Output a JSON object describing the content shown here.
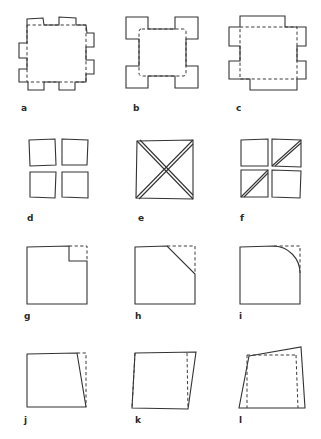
{
  "figure": {
    "background_color": "#ffffff",
    "stroke_color": "#333333",
    "dashed_stroke_color": "#3a3a3a",
    "label_color": "#2a2a2a",
    "rows": 4,
    "columns": 3,
    "panels": [
      {
        "id": "a",
        "label": "a",
        "label_x": 21,
        "label_y": 104,
        "description": "Square outline with eight rectangular tabs, two on each side, and a dashed inner square",
        "tabs": 8,
        "tabs_per_side": 2,
        "has_dashed_reference": true,
        "dashed_reference_shape": "square"
      },
      {
        "id": "b",
        "label": "b",
        "label_x": 133,
        "label_y": 104,
        "description": "Square with four rectangular tabs at the corners and a dashed rounded inner square",
        "tabs": 4,
        "tab_position": "corners",
        "has_dashed_reference": true,
        "dashed_reference_shape": "rounded-square"
      },
      {
        "id": "c",
        "label": "c",
        "label_x": 236,
        "label_y": 104,
        "description": "Square with four rectangular tabs centered on each side and a dashed inner square",
        "tabs": 4,
        "tab_position": "side-centers",
        "has_dashed_reference": true,
        "dashed_reference_shape": "square"
      },
      {
        "id": "d",
        "label": "d",
        "label_x": 27,
        "label_y": 214,
        "description": "Four separate small squares arranged in a two-by-two grid with gaps",
        "sub_squares": 4,
        "grid": "2x2",
        "has_dashed_reference": false
      },
      {
        "id": "e",
        "label": "e",
        "label_x": 138,
        "label_y": 214,
        "description": "Square outline crossed by two double-line diagonals forming an X",
        "diagonals": 2,
        "diagonal_style": "double-line",
        "has_dashed_reference": false
      },
      {
        "id": "f",
        "label": "f",
        "label_x": 240,
        "label_y": 214,
        "description": "Two-by-two grid of squares with double-line diagonals in the top-right and bottom-left cells",
        "sub_squares": 4,
        "grid": "2x2",
        "diagonal_cells": [
          "top-right",
          "bottom-left"
        ],
        "diagonal_style": "double-line",
        "has_dashed_reference": false
      },
      {
        "id": "g",
        "label": "g",
        "label_x": 24,
        "label_y": 312,
        "description": "Square with a small rectangular notch removed from the top-right corner, dashed lines completing the corner",
        "cut_type": "rectangular-notch",
        "cut_corner": "top-right",
        "has_dashed_reference": true
      },
      {
        "id": "h",
        "label": "h",
        "label_x": 135,
        "label_y": 312,
        "description": "Square with the top-right corner cut off by a straight diagonal, dashed lines completing the corner",
        "cut_type": "diagonal-chamfer",
        "cut_corner": "top-right",
        "has_dashed_reference": true
      },
      {
        "id": "i",
        "label": "i",
        "label_x": 239,
        "label_y": 312,
        "description": "Square with a concave circular arc removed from the top-right corner, dashed lines completing the corner",
        "cut_type": "concave-arc",
        "cut_corner": "top-right",
        "has_dashed_reference": true
      },
      {
        "id": "j",
        "label": "j",
        "label_x": 24,
        "label_y": 416,
        "description": "Quadrilateral with the right edge slanted inward at the top, dashed vertical line marking the original square edge",
        "distortion": "slight-right-edge-slant",
        "has_dashed_reference": true
      },
      {
        "id": "k",
        "label": "k",
        "label_x": 135,
        "label_y": 416,
        "description": "Parallelogram sheared to the right, dashed vertical lines marking the original square edges",
        "distortion": "shear",
        "has_dashed_reference": true
      },
      {
        "id": "l",
        "label": "l",
        "label_x": 239,
        "label_y": 416,
        "description": "Irregular quadrilateral with the top edge tilted upward to the right and splayed sides, dashed lines marking the original square",
        "distortion": "tilted-top-and-splay",
        "has_dashed_reference": true
      }
    ]
  }
}
